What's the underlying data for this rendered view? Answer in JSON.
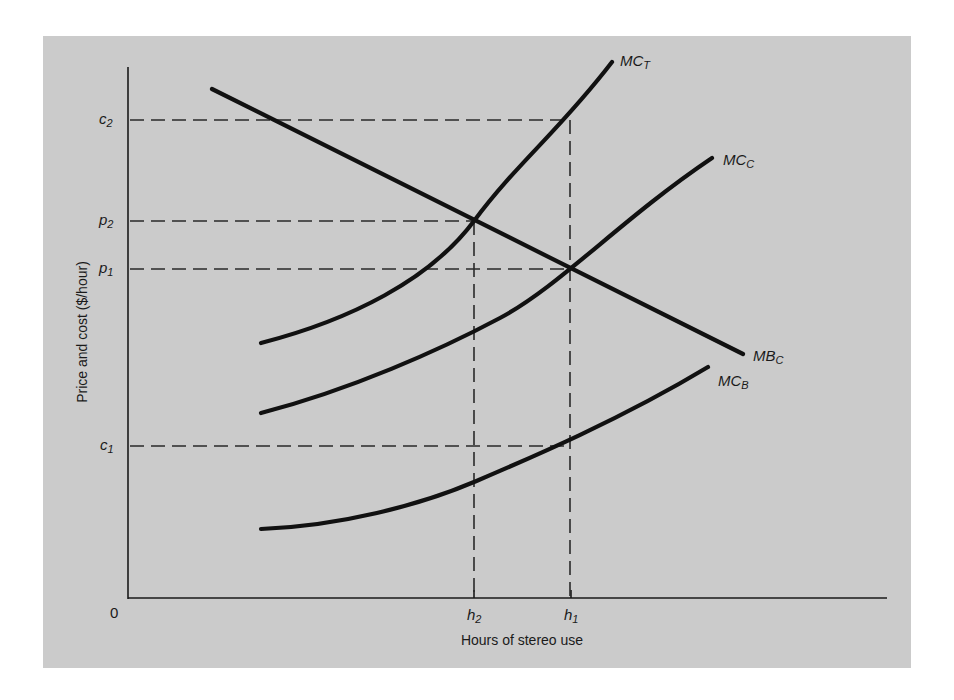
{
  "diagram": {
    "type": "economics-marginal-cost-benefit",
    "background_color": "#cbcbcb",
    "line_color": "#111111",
    "axes": {
      "y_title": "Price and cost ($/hour)",
      "x_title": "Hours of stereo use",
      "origin_label": "0"
    },
    "y_ticks": [
      {
        "base": "c",
        "sub": "2",
        "name": "c2"
      },
      {
        "base": "p",
        "sub": "2",
        "name": "p2"
      },
      {
        "base": "p",
        "sub": "1",
        "name": "p1"
      },
      {
        "base": "c",
        "sub": "1",
        "name": "c1"
      }
    ],
    "x_ticks": [
      {
        "base": "h",
        "sub": "2",
        "name": "h2"
      },
      {
        "base": "h",
        "sub": "1",
        "name": "h1"
      }
    ],
    "curves": [
      {
        "base": "MC",
        "sub": "T",
        "name": "MC_T",
        "description": "Total marginal cost (rising, convex)"
      },
      {
        "base": "MC",
        "sub": "C",
        "name": "MC_C",
        "description": "Marginal cost to consumer (rising)"
      },
      {
        "base": "MB",
        "sub": "C",
        "name": "MB_C",
        "description": "Marginal benefit to consumer (falling, linear)"
      },
      {
        "base": "MC",
        "sub": "B",
        "name": "MC_B",
        "description": "Marginal cost borne by others (rising, convex)"
      }
    ],
    "intersections": [
      {
        "curves": [
          "MB_C",
          "MC_T"
        ],
        "x": "h2",
        "y": "p2"
      },
      {
        "curves": [
          "MB_C",
          "MC_C"
        ],
        "x": "h1",
        "y": "p1"
      }
    ]
  }
}
